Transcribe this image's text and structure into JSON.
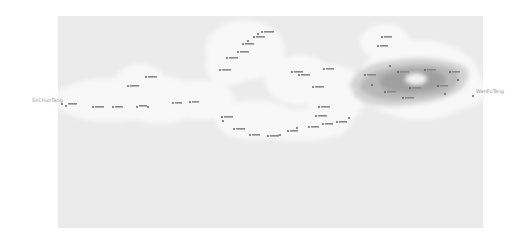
{
  "map": {
    "background_color": "#ffffff",
    "area": {
      "x": 58,
      "y": 16,
      "width": 425,
      "height": 212,
      "color": "#ebebeb"
    },
    "buffer_color": "#f7f7f7",
    "density_colors": [
      "#d6d6d6",
      "#b9b9b9",
      "#9f9f9f"
    ],
    "endpoints": [
      {
        "label": "SeChunTang",
        "x": 58,
        "y": 101
      },
      {
        "label": "WanFuTang",
        "x": 470,
        "y": 92
      }
    ],
    "points": [
      {
        "x": 62,
        "y": 104
      },
      {
        "x": 66,
        "y": 106
      },
      {
        "x": 93,
        "y": 107
      },
      {
        "x": 113,
        "y": 107
      },
      {
        "x": 137,
        "y": 107
      },
      {
        "x": 148,
        "y": 107
      },
      {
        "x": 128,
        "y": 86
      },
      {
        "x": 146,
        "y": 77
      },
      {
        "x": 173,
        "y": 103
      },
      {
        "x": 190,
        "y": 102
      },
      {
        "x": 220,
        "y": 70
      },
      {
        "x": 227,
        "y": 58
      },
      {
        "x": 238,
        "y": 52
      },
      {
        "x": 243,
        "y": 44
      },
      {
        "x": 248,
        "y": 41
      },
      {
        "x": 254,
        "y": 37
      },
      {
        "x": 258,
        "y": 34
      },
      {
        "x": 262,
        "y": 32
      },
      {
        "x": 222,
        "y": 117
      },
      {
        "x": 223,
        "y": 121
      },
      {
        "x": 234,
        "y": 129
      },
      {
        "x": 250,
        "y": 135
      },
      {
        "x": 268,
        "y": 136
      },
      {
        "x": 280,
        "y": 135
      },
      {
        "x": 288,
        "y": 131
      },
      {
        "x": 297,
        "y": 128
      },
      {
        "x": 309,
        "y": 127
      },
      {
        "x": 323,
        "y": 124
      },
      {
        "x": 337,
        "y": 122
      },
      {
        "x": 349,
        "y": 118
      },
      {
        "x": 292,
        "y": 72
      },
      {
        "x": 299,
        "y": 75
      },
      {
        "x": 324,
        "y": 69
      },
      {
        "x": 313,
        "y": 87
      },
      {
        "x": 319,
        "y": 107
      },
      {
        "x": 316,
        "y": 116
      },
      {
        "x": 382,
        "y": 37
      },
      {
        "x": 378,
        "y": 46
      },
      {
        "x": 473,
        "y": 96
      }
    ],
    "labels_note": "Small Chinese village name labels beside each point (illegible at source resolution)"
  }
}
